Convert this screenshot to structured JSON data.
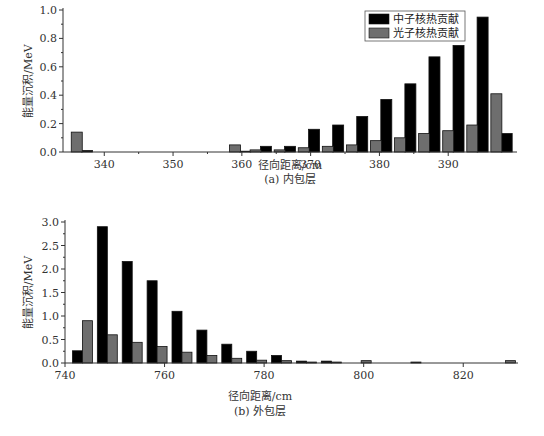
{
  "chart_data": [
    {
      "type": "bar",
      "title": "(a) 内包层",
      "xlabel": "径向距离/cm",
      "ylabel": "能量沉积/MeV",
      "xlim": [
        334,
        400
      ],
      "ylim": [
        0,
        1.0
      ],
      "xticks": [
        340,
        350,
        360,
        370,
        380,
        390
      ],
      "yticks": [
        "0.0",
        "0.2",
        "0.4",
        "0.6",
        "0.8",
        "1.0"
      ],
      "grid": false,
      "legend_position": "top-right",
      "series": [
        {
          "name": "中子核热贡献",
          "color": "#000000",
          "x": [
            337.5,
            360.5,
            363.5,
            367,
            370.5,
            374,
            377.5,
            381,
            384.5,
            388,
            391.5,
            395,
            398.5
          ],
          "values": [
            0.01,
            0.005,
            0.04,
            0.04,
            0.16,
            0.19,
            0.25,
            0.37,
            0.48,
            0.67,
            0.75,
            0.95,
            0.13
          ]
        },
        {
          "name": "光子核热贡献",
          "color": "#6e6e6e",
          "x": [
            336,
            359,
            362,
            365.5,
            369,
            372.5,
            376,
            379.5,
            383,
            386.5,
            390,
            393.5,
            397
          ],
          "values": [
            0.14,
            0.05,
            0.015,
            0.015,
            0.03,
            0.04,
            0.05,
            0.08,
            0.1,
            0.13,
            0.15,
            0.19,
            0.41
          ]
        }
      ]
    },
    {
      "type": "bar",
      "title": "(b) 外包层",
      "xlabel": "径向距离/cm",
      "ylabel": "能量沉积/MeV",
      "xlim": [
        740,
        831
      ],
      "ylim": [
        0,
        3.0
      ],
      "xticks": [
        740,
        760,
        780,
        800,
        820
      ],
      "yticks": [
        "0.0",
        "0.5",
        "1.0",
        "1.5",
        "2.0",
        "2.5",
        "3.0"
      ],
      "grid": false,
      "series": [
        {
          "name": "中子核热贡献",
          "color": "#000000",
          "x": [
            742.5,
            747.5,
            752.5,
            757.5,
            762.5,
            767.5,
            772.5,
            777.5,
            782.5,
            787.5,
            792.5,
            810.5
          ],
          "values": [
            0.26,
            2.9,
            2.16,
            1.75,
            1.1,
            0.7,
            0.4,
            0.25,
            0.16,
            0.04,
            0.04,
            0.02
          ]
        },
        {
          "name": "光子核热贡献",
          "color": "#6e6e6e",
          "x": [
            744.5,
            749.5,
            754.5,
            759.5,
            764.5,
            769.5,
            774.5,
            779.5,
            784.5,
            789.5,
            794.5,
            800.5,
            829.5
          ],
          "values": [
            0.9,
            0.6,
            0.44,
            0.35,
            0.23,
            0.16,
            0.1,
            0.06,
            0.05,
            0.02,
            0.02,
            0.05,
            0.05
          ]
        }
      ]
    }
  ],
  "labels": {
    "top": {
      "xlabel": "径向距离/cm",
      "caption": "(a) 内包层",
      "ylabel": "能量沉积/MeV"
    },
    "bottom": {
      "xlabel": "径向距离/cm",
      "caption": "(b) 外包层",
      "ylabel": "能量沉积/MeV"
    },
    "legend": {
      "neutron": "中子核热贡献",
      "photon": "光子核热贡献"
    }
  }
}
